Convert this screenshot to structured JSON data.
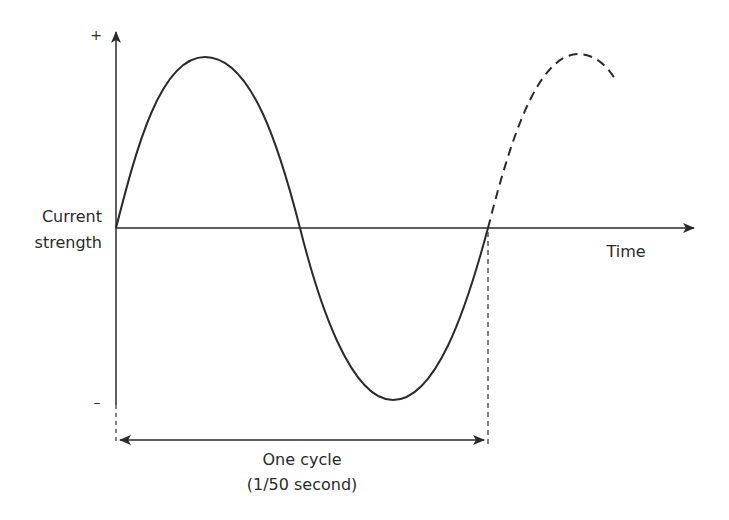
{
  "diagram": {
    "y_axis": {
      "label_line1": "Current",
      "label_line2": "strength",
      "positive_mark": "+",
      "negative_mark": "–"
    },
    "x_axis": {
      "label": "Time"
    },
    "cycle_annotation": {
      "label": "One cycle",
      "sublabel": "(1/50 second)"
    },
    "colors": {
      "stroke": "#2a2a2a",
      "background": "#ffffff"
    }
  }
}
